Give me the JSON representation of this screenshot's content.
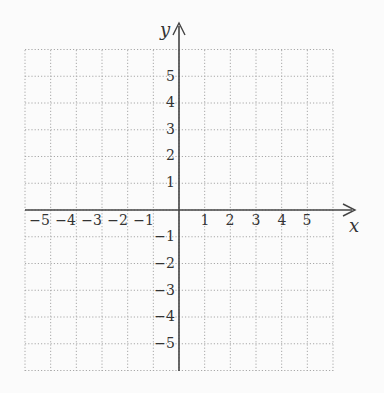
{
  "diagram": {
    "type": "coordinate-plane",
    "x_axis_label": "x",
    "y_axis_label": "y",
    "x_range": [
      -6,
      6
    ],
    "y_range": [
      -6,
      6
    ],
    "grid_step": 1,
    "grid_style": "dotted",
    "x_ticks": [
      "−5",
      "−4",
      "−3",
      "−2",
      "−1",
      "1",
      "2",
      "3",
      "4",
      "5"
    ],
    "y_ticks_positive": [
      "5",
      "4",
      "3",
      "2",
      "1"
    ],
    "y_ticks_negative": [
      "−1",
      "−2",
      "−3",
      "−4",
      "−5"
    ],
    "colors": {
      "grid": "#a8a8a8",
      "axis": "#444444",
      "background": "#fbfbfb",
      "text": "#333333"
    }
  }
}
